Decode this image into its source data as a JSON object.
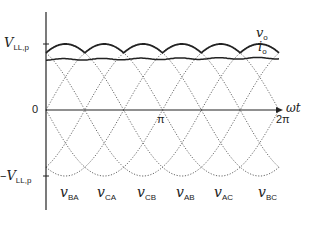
{
  "diagram": {
    "title": "",
    "y_axis": {
      "pos_label": {
        "main": "V",
        "sub": "LL,p"
      },
      "neg_label": {
        "prefix": "−",
        "main": "V",
        "sub": "LL,p"
      },
      "zero_label": "0"
    },
    "x_axis": {
      "label": "ωt",
      "ticks": [
        {
          "label": "π"
        },
        {
          "label": "2π"
        }
      ]
    },
    "curves": {
      "output_voltage": {
        "main": "v",
        "sub": "o"
      },
      "output_current": {
        "main": "i",
        "sub": "o"
      }
    },
    "line_voltages": [
      {
        "main": "v",
        "sub": "BA"
      },
      {
        "main": "v",
        "sub": "CA"
      },
      {
        "main": "v",
        "sub": "CB"
      },
      {
        "main": "v",
        "sub": "AB"
      },
      {
        "main": "v",
        "sub": "AC"
      },
      {
        "main": "v",
        "sub": "BC"
      }
    ],
    "colors": {
      "ink": "#222222",
      "dotted": "#555555"
    }
  }
}
